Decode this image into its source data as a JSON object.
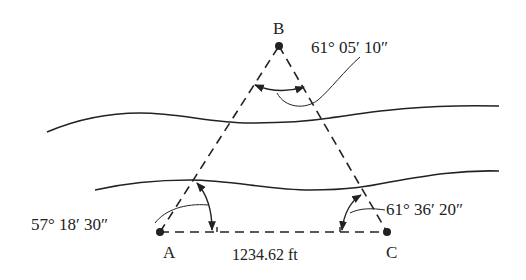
{
  "diagram": {
    "type": "survey-triangulation",
    "points": {
      "A": {
        "label": "A"
      },
      "B": {
        "label": "B"
      },
      "C": {
        "label": "C"
      }
    },
    "angles": {
      "B": "61°  05′  10″",
      "A": "57°  18′  30″",
      "C": "61°  36′  20″"
    },
    "baseline": {
      "label": "1234.62 ft"
    },
    "colors": {
      "line": "#222222",
      "background": "#ffffff"
    }
  }
}
